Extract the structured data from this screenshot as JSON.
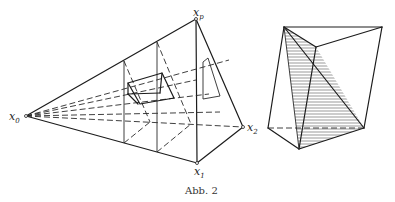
{
  "figure": {
    "caption": "Abb. 2",
    "left_panel": {
      "description": "Perspective pyramid with apex x0 projecting a box onto picture planes",
      "labels": {
        "x0": {
          "base": "x",
          "sub": "0"
        },
        "xp": {
          "base": "x",
          "sub": "p"
        },
        "x1": {
          "base": "x",
          "sub": "1"
        },
        "x2": {
          "base": "x",
          "sub": "2"
        }
      },
      "vertices": {
        "x0": [
          26,
          116
        ],
        "xp": [
          196,
          19
        ],
        "x1": [
          197,
          163
        ],
        "x2": [
          243,
          127
        ]
      }
    },
    "right_panel": {
      "description": "Polyhedron with hatched interior triangular section",
      "vertices": {
        "top_left": [
          284,
          27
        ],
        "top_right": [
          382,
          27
        ],
        "mid_top": [
          316,
          47
        ],
        "left": [
          268,
          128
        ],
        "bottom": [
          299,
          149
        ],
        "right": [
          364,
          128
        ]
      }
    }
  },
  "colors": {
    "line": "#1c1c1c",
    "background": "#ffffff"
  }
}
